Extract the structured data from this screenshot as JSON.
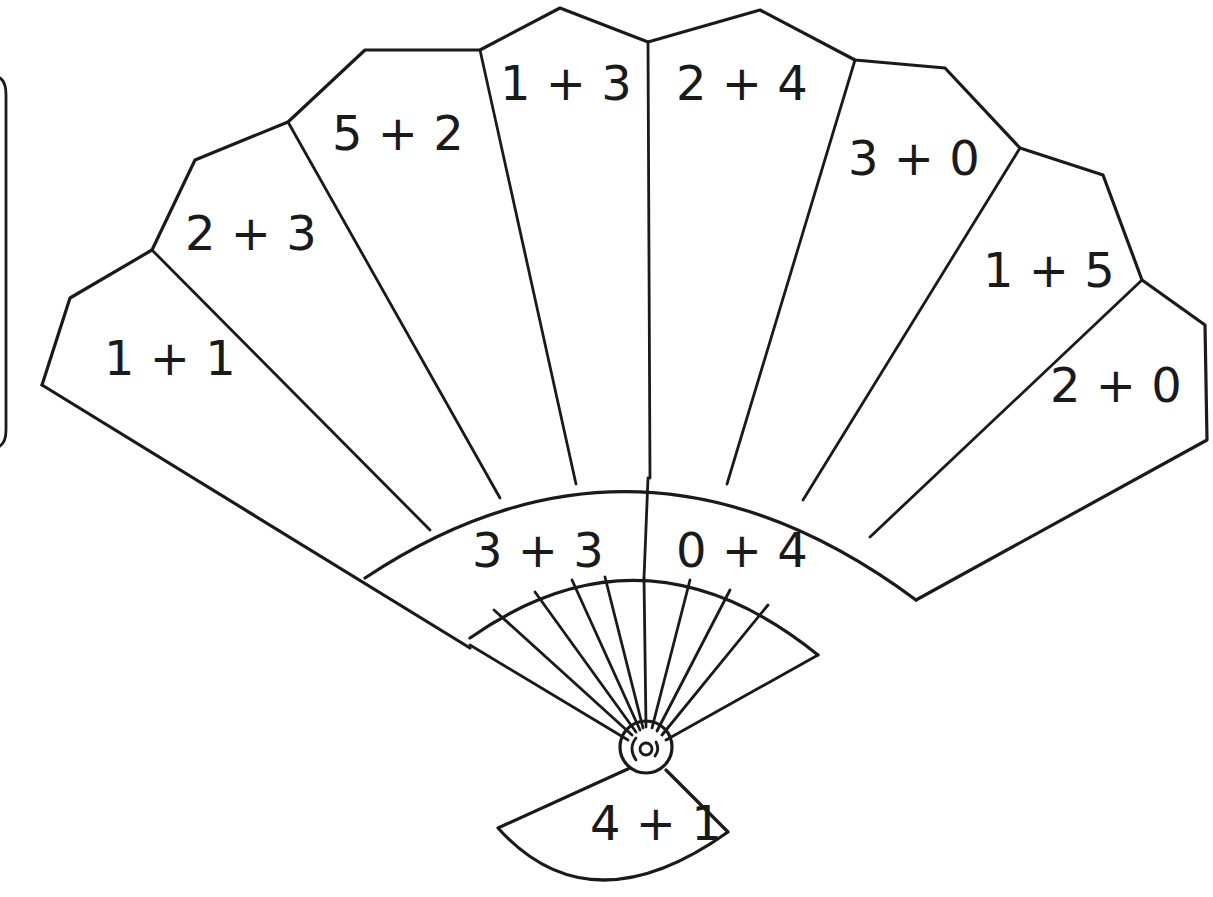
{
  "worksheet": {
    "figure": "hand-fan",
    "fan_panels": [
      {
        "id": "panel-1",
        "expr": "1 + 1",
        "x": 104,
        "y": 375
      },
      {
        "id": "panel-2",
        "expr": "2 + 3",
        "x": 185,
        "y": 250
      },
      {
        "id": "panel-3",
        "expr": "5 + 2",
        "x": 332,
        "y": 150
      },
      {
        "id": "panel-4",
        "expr": "1 + 3",
        "x": 500,
        "y": 100
      },
      {
        "id": "panel-5",
        "expr": "2 + 4",
        "x": 676,
        "y": 100
      },
      {
        "id": "panel-6",
        "expr": "3 + 0",
        "x": 848,
        "y": 175
      },
      {
        "id": "panel-7",
        "expr": "1 + 5",
        "x": 983,
        "y": 287
      },
      {
        "id": "panel-8",
        "expr": "2 + 0",
        "x": 1050,
        "y": 402
      }
    ],
    "band_panels": [
      {
        "id": "band-left",
        "expr": "3 + 3",
        "x": 472,
        "y": 567
      },
      {
        "id": "band-right",
        "expr": "0 + 4",
        "x": 676,
        "y": 567
      }
    ],
    "handle_panel": {
      "id": "handle",
      "expr": "4 + 1",
      "x": 590,
      "y": 840
    }
  }
}
